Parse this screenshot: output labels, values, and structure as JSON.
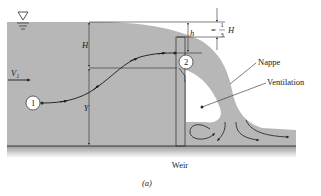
{
  "figure": {
    "caption": "(a)",
    "type": "Sharp-crested weir flow schematic"
  },
  "labels": {
    "H": "H",
    "h": "h",
    "Y": "Y",
    "V1_main": "V",
    "V1_sub": "1",
    "third_eq": "=",
    "third_num": "1",
    "third_den": "3",
    "third_H": "H",
    "point1": "1",
    "point2": "2",
    "nappe": "Nappe",
    "ventilation": "Ventilation",
    "weir": "Weir"
  },
  "icons": {
    "free_surface": "inverted-triangle-water-surface-icon"
  },
  "colors": {
    "water": "#b7b7b7",
    "line": "#2a2a2a",
    "background": "#ffffff",
    "ventilation": "#ffffff"
  }
}
